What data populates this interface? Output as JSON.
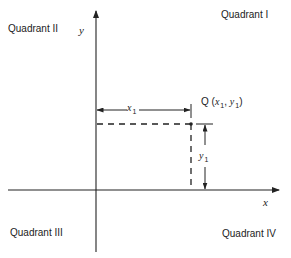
{
  "diagram": {
    "quadrants": {
      "q1": "Quadrant  I",
      "q2": "Quadrant  II",
      "q3": "Quadrant  III",
      "q4": "Quadrant  IV"
    },
    "axes": {
      "x_label": "x",
      "y_label": "y"
    },
    "point": {
      "name": "Q",
      "open": "(",
      "x_var": "x",
      "x_sub": "1",
      "sep": ", ",
      "y_var": "y",
      "y_sub": "1",
      "close": ")"
    },
    "dimensions": {
      "horizontal_var": "x",
      "horizontal_sub": "1",
      "vertical_var": "y",
      "vertical_sub": "1"
    },
    "colors": {
      "line": "#222222",
      "text": "#222222",
      "background": "#ffffff"
    }
  }
}
